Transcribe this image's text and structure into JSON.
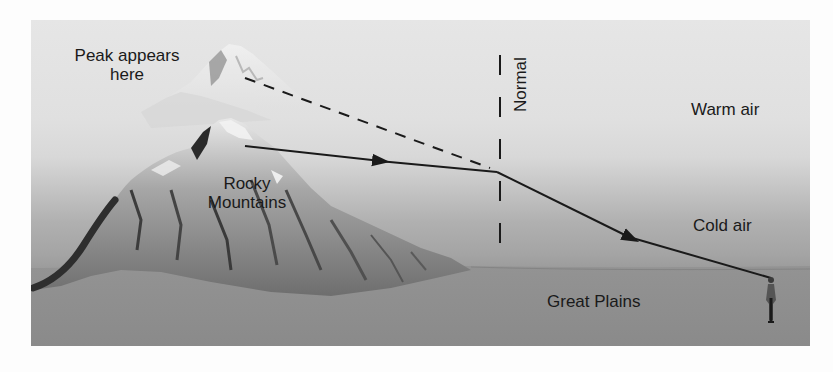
{
  "diagram": {
    "labels": {
      "apparent_peak_line1": "Peak appears",
      "apparent_peak_line2": "here",
      "mountains_line1": "Rocky",
      "mountains_line2": "Mountains",
      "normal": "Normal",
      "warm_air": "Warm air",
      "cold_air": "Cold air",
      "plains": "Great Plains"
    },
    "colors": {
      "ink": "#1a1a1a",
      "sky_top": "#e6e6e6",
      "cold_air_band": "#a8a8a8",
      "ground": "#8c8c8c",
      "mountain_light": "#d8d8d8",
      "mountain_dark": "#3a3a3a"
    },
    "elements": {
      "actual_ray": "solid line with arrowheads from the real peak, bending at the warm/cold air boundary, reaching the observer",
      "apparent_ray": "dashed line extended back from the observer's line of sight to the apparent (raised) peak",
      "normal_line": "dashed vertical line at the refraction point",
      "observer": "standing person figure on the plains"
    }
  }
}
